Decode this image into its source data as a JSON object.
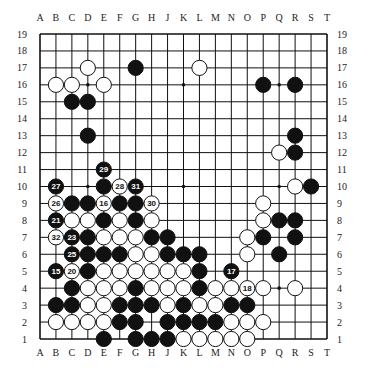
{
  "diagram": {
    "board_size": 19,
    "columns": [
      "A",
      "B",
      "C",
      "D",
      "E",
      "F",
      "G",
      "H",
      "J",
      "K",
      "L",
      "M",
      "N",
      "O",
      "P",
      "Q",
      "R",
      "S",
      "T"
    ],
    "rows": [
      19,
      18,
      17,
      16,
      15,
      14,
      13,
      12,
      11,
      10,
      9,
      8,
      7,
      6,
      5,
      4,
      3,
      2,
      1
    ],
    "star_points": [
      "D16",
      "K16",
      "Q16",
      "D10",
      "K10",
      "Q10",
      "D4",
      "K4",
      "Q4"
    ],
    "colors": {
      "black": "#111111",
      "white": "#ffffff",
      "line": "#111111",
      "background": "#ffffff"
    },
    "black_stones": [
      {
        "pos": "G17"
      },
      {
        "pos": "P16"
      },
      {
        "pos": "R16"
      },
      {
        "pos": "C15"
      },
      {
        "pos": "D15"
      },
      {
        "pos": "D13"
      },
      {
        "pos": "R13"
      },
      {
        "pos": "R12"
      },
      {
        "pos": "E11",
        "label": "29"
      },
      {
        "pos": "B10",
        "label": "27"
      },
      {
        "pos": "E10"
      },
      {
        "pos": "G10",
        "label": "31"
      },
      {
        "pos": "S10"
      },
      {
        "pos": "C9"
      },
      {
        "pos": "D9"
      },
      {
        "pos": "F9"
      },
      {
        "pos": "G9"
      },
      {
        "pos": "B8",
        "label": "21"
      },
      {
        "pos": "E8"
      },
      {
        "pos": "G8"
      },
      {
        "pos": "Q8"
      },
      {
        "pos": "R8"
      },
      {
        "pos": "C7",
        "label": "23"
      },
      {
        "pos": "D7"
      },
      {
        "pos": "H7"
      },
      {
        "pos": "J7"
      },
      {
        "pos": "P7"
      },
      {
        "pos": "R7"
      },
      {
        "pos": "C6",
        "label": "25"
      },
      {
        "pos": "D6"
      },
      {
        "pos": "E6"
      },
      {
        "pos": "F6"
      },
      {
        "pos": "J6"
      },
      {
        "pos": "K6"
      },
      {
        "pos": "L6"
      },
      {
        "pos": "Q6"
      },
      {
        "pos": "B5",
        "label": "15"
      },
      {
        "pos": "D5"
      },
      {
        "pos": "L5"
      },
      {
        "pos": "N5",
        "label": "17"
      },
      {
        "pos": "C4"
      },
      {
        "pos": "G4"
      },
      {
        "pos": "L4"
      },
      {
        "pos": "B3"
      },
      {
        "pos": "C3"
      },
      {
        "pos": "F3"
      },
      {
        "pos": "G3"
      },
      {
        "pos": "H3"
      },
      {
        "pos": "K3"
      },
      {
        "pos": "N3"
      },
      {
        "pos": "O3"
      },
      {
        "pos": "F2"
      },
      {
        "pos": "G2"
      },
      {
        "pos": "J2"
      },
      {
        "pos": "K2"
      },
      {
        "pos": "L2"
      },
      {
        "pos": "M2"
      },
      {
        "pos": "E1"
      },
      {
        "pos": "G1"
      },
      {
        "pos": "H1"
      },
      {
        "pos": "J1"
      }
    ],
    "white_stones": [
      {
        "pos": "D17"
      },
      {
        "pos": "L17"
      },
      {
        "pos": "B16"
      },
      {
        "pos": "C16"
      },
      {
        "pos": "E16"
      },
      {
        "pos": "Q12"
      },
      {
        "pos": "F10",
        "label": "28"
      },
      {
        "pos": "R10"
      },
      {
        "pos": "B9",
        "label": "26"
      },
      {
        "pos": "E9",
        "label": "16"
      },
      {
        "pos": "H9",
        "label": "30"
      },
      {
        "pos": "P9"
      },
      {
        "pos": "C8"
      },
      {
        "pos": "D8"
      },
      {
        "pos": "F8"
      },
      {
        "pos": "H8"
      },
      {
        "pos": "P8"
      },
      {
        "pos": "B7",
        "label": "32"
      },
      {
        "pos": "E7"
      },
      {
        "pos": "F7"
      },
      {
        "pos": "G7"
      },
      {
        "pos": "O7"
      },
      {
        "pos": "G6"
      },
      {
        "pos": "H6"
      },
      {
        "pos": "O6"
      },
      {
        "pos": "C5",
        "label": "20"
      },
      {
        "pos": "E5"
      },
      {
        "pos": "F5"
      },
      {
        "pos": "G5"
      },
      {
        "pos": "H5"
      },
      {
        "pos": "J5"
      },
      {
        "pos": "K5"
      },
      {
        "pos": "D4"
      },
      {
        "pos": "E4"
      },
      {
        "pos": "F4"
      },
      {
        "pos": "H4"
      },
      {
        "pos": "J4"
      },
      {
        "pos": "K4"
      },
      {
        "pos": "M4"
      },
      {
        "pos": "N4"
      },
      {
        "pos": "O4",
        "label": "18"
      },
      {
        "pos": "P4"
      },
      {
        "pos": "R4"
      },
      {
        "pos": "D3"
      },
      {
        "pos": "E3"
      },
      {
        "pos": "J3"
      },
      {
        "pos": "L3"
      },
      {
        "pos": "M3"
      },
      {
        "pos": "B2"
      },
      {
        "pos": "C2"
      },
      {
        "pos": "D2"
      },
      {
        "pos": "E2"
      },
      {
        "pos": "N2"
      },
      {
        "pos": "O2"
      },
      {
        "pos": "P2"
      },
      {
        "pos": "K1"
      },
      {
        "pos": "L1"
      },
      {
        "pos": "M1"
      },
      {
        "pos": "N1"
      },
      {
        "pos": "O1"
      }
    ]
  }
}
